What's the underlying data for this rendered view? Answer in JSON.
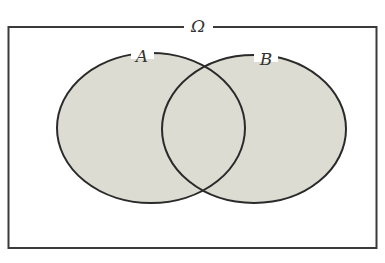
{
  "diagram": {
    "type": "venn",
    "universe_label": "Ω",
    "sets": [
      {
        "label": "A"
      },
      {
        "label": "B"
      }
    ],
    "colors": {
      "fill": "#dcdcd2",
      "stroke": "#2a2a2a",
      "frame": "#3a3a3a"
    }
  }
}
